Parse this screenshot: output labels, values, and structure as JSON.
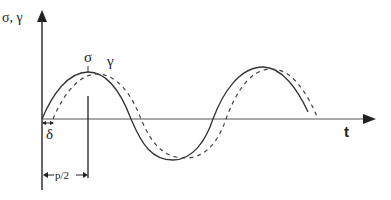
{
  "diagram": {
    "type": "waveform",
    "y_axis_label": "σ, γ",
    "x_axis_label": "t",
    "curves": [
      {
        "name": "σ",
        "label": "σ",
        "style": "solid",
        "description": "stress sinusoid, leading"
      },
      {
        "name": "γ",
        "label": "γ",
        "style": "dashed",
        "description": "strain sinusoid, lagging by δ"
      }
    ],
    "annotations": {
      "phase_lag": "δ",
      "half_period": "p/2"
    },
    "colors": {
      "line": "#333333",
      "background": "#ffffff"
    }
  }
}
